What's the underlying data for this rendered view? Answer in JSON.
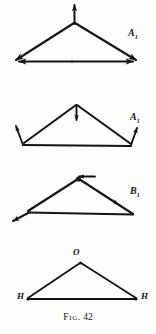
{
  "figure": {
    "caption_word": "Fig.",
    "caption_number": "42",
    "caption_full": "Fig. 42",
    "ink_color": "#141414",
    "background_color": "#fdfdfc"
  },
  "diagrams": [
    {
      "id": "diagram-1",
      "label": "A",
      "label_subscript": "1",
      "description": "Triangle with upward arrow at apex and outward arrows along the base",
      "arrows": [
        "apex-up",
        "base-left-out",
        "base-right-out"
      ]
    },
    {
      "id": "diagram-2",
      "label": "A",
      "label_subscript": "1",
      "description": "Flatter triangle with downward arrow at apex and outward arrows at base vertices",
      "arrows": [
        "apex-down",
        "vertex-left-up",
        "vertex-right-up"
      ]
    },
    {
      "id": "diagram-3",
      "label": "B",
      "label_subscript": "1",
      "description": "Triangle with horizontal arrow at apex, arrow down the right side and arrow out at left vertex",
      "arrows": [
        "apex-left-horizontal",
        "right-side-down",
        "base-left-out"
      ]
    },
    {
      "id": "diagram-4",
      "label": "",
      "label_subscript": "",
      "description": "Plain triangle with labeled vertices",
      "vertex_labels": {
        "apex": "O",
        "base_left": "H",
        "base_right": "H"
      }
    }
  ]
}
